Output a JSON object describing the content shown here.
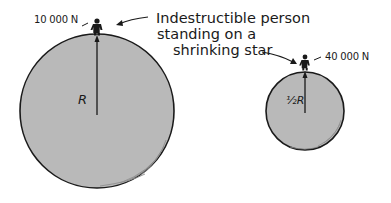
{
  "diagram": {
    "caption": {
      "line1": "Indestructible person",
      "line2": "standing on a",
      "line3": "shrinking star"
    },
    "large_star": {
      "radius_label": "R",
      "force_label": "10 000 N"
    },
    "small_star": {
      "radius_label": "½R",
      "force_label": "40 000 N"
    },
    "colors": {
      "star_fill": "#b8b8b8",
      "outline": "#1a1a1a"
    }
  }
}
